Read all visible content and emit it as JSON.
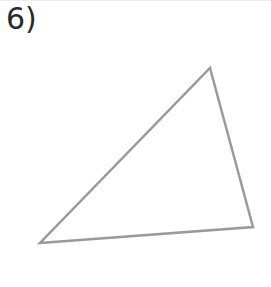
{
  "problem": {
    "label": "6)"
  },
  "figure": {
    "shape": "triangle",
    "stroke_color": "#9a9a9a",
    "vertices": [
      {
        "name": "top",
        "x": 210,
        "y": 68
      },
      {
        "name": "right",
        "x": 253,
        "y": 227
      },
      {
        "name": "left",
        "x": 40,
        "y": 243
      }
    ]
  }
}
